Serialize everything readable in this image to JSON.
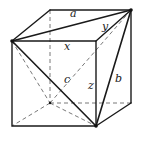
{
  "figure": {
    "stroke_color": "#1a1a1a",
    "hidden_stroke_color": "#6a6a6a"
  },
  "labels": {
    "a": "a",
    "b": "b",
    "c": "c",
    "x": "x",
    "y": "y",
    "z": "z"
  }
}
